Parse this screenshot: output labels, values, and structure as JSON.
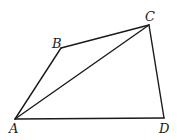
{
  "diagram": {
    "title": "",
    "type": "quadrilateral-with-diagonal",
    "vertices": [
      {
        "id": "A",
        "label": "A",
        "x": 15,
        "y": 119,
        "label_x": 9,
        "label_y": 133
      },
      {
        "id": "B",
        "label": "B",
        "x": 61,
        "y": 48,
        "label_x": 52,
        "label_y": 48
      },
      {
        "id": "C",
        "label": "C",
        "x": 149,
        "y": 25,
        "label_x": 145,
        "label_y": 21
      },
      {
        "id": "D",
        "label": "D",
        "x": 164,
        "y": 118,
        "label_x": 159,
        "label_y": 133
      }
    ],
    "edges": [
      {
        "id": "AB",
        "from": "A",
        "to": "B"
      },
      {
        "id": "BC",
        "from": "B",
        "to": "C"
      },
      {
        "id": "CD",
        "from": "C",
        "to": "D"
      },
      {
        "id": "DA",
        "from": "D",
        "to": "A"
      },
      {
        "id": "AC",
        "from": "A",
        "to": "C",
        "kind": "diagonal"
      }
    ],
    "stroke_color": "#1a1a1a",
    "background": "#ffffff"
  }
}
